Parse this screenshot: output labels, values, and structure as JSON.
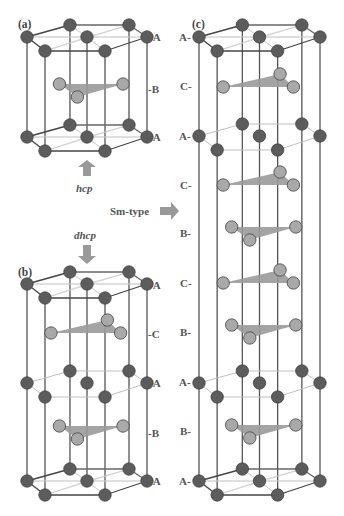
{
  "figure": {
    "panels": [
      {
        "id": "a",
        "label": "(a)",
        "caption": "hcp",
        "layers": [
          "-A",
          "-B",
          "-A"
        ]
      },
      {
        "id": "b",
        "label": "(b)",
        "caption": "dhcp",
        "layers": [
          "-A",
          "-C",
          "-A",
          "-B",
          "-A"
        ]
      },
      {
        "id": "c",
        "label": "(c)",
        "caption": "Sm-type",
        "layers": [
          "A-",
          "C-",
          "A-",
          "C-",
          "B-",
          "C-",
          "B-",
          "A-",
          "B-",
          "A-"
        ]
      }
    ],
    "arrows": [
      {
        "from": "a",
        "to": "b",
        "direction": "up",
        "label": "hcp"
      },
      {
        "from": "b",
        "to": "a",
        "direction": "down",
        "label": "dhcp"
      },
      {
        "to": "c",
        "direction": "right",
        "label": "Sm-type"
      }
    ],
    "colors": {
      "atom_A": "#5c5c5c",
      "atom_BC": "#a9a9a9",
      "triangle": "#9a9a9a",
      "edge": "#555555",
      "thin_edge": "#c0c0c0"
    }
  }
}
